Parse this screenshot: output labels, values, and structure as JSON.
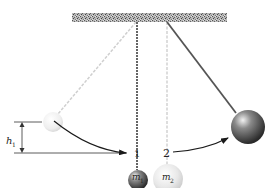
{
  "diagram": {
    "labels": {
      "height": "h",
      "height_sub": "1",
      "mass1": "m",
      "mass1_sub": "1",
      "mass2": "m",
      "mass2_sub": "2",
      "ball1_number": "1",
      "ball2_number": "2"
    },
    "colors": {
      "ceiling": "#8a8a8a",
      "string_solid": "#555555",
      "string_ghost": "#cfcfcf",
      "ball_dark": "#3a3a3a",
      "ball_light": "#e6e6e6",
      "arrow": "#1a1a1a"
    }
  }
}
